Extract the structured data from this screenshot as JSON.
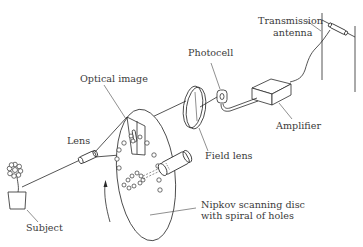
{
  "diagram": {
    "labels": {
      "transmission_antenna_line1": "Transmission",
      "transmission_antenna_line2": "antenna",
      "photocell": "Photocell",
      "optical_image": "Optical image",
      "amplifier": "Amplifier",
      "lens": "Lens",
      "field_lens": "Field lens",
      "nipkov_line1": "Nipkov scanning disc",
      "nipkov_line2": "with spiral of holes",
      "subject": "Subject"
    },
    "components": [
      {
        "id": "subject",
        "icon": "flower-pot-icon"
      },
      {
        "id": "lens",
        "icon": "cylinder-lens-icon"
      },
      {
        "id": "nipkov-disc",
        "icon": "disc-with-holes-icon"
      },
      {
        "id": "field-lens",
        "icon": "lens-disc-icon"
      },
      {
        "id": "photocell",
        "icon": "photocell-icon"
      },
      {
        "id": "amplifier",
        "icon": "box-icon"
      },
      {
        "id": "transmission-antenna",
        "icon": "dipole-antenna-icon"
      }
    ],
    "signal_path": [
      "Subject",
      "Lens",
      "Optical image",
      "Nipkov scanning disc",
      "Field lens",
      "Photocell",
      "Amplifier",
      "Transmission antenna"
    ],
    "colors": {
      "line": "#2a2a2a",
      "text": "#3a3a3a",
      "background": "#ffffff"
    }
  }
}
